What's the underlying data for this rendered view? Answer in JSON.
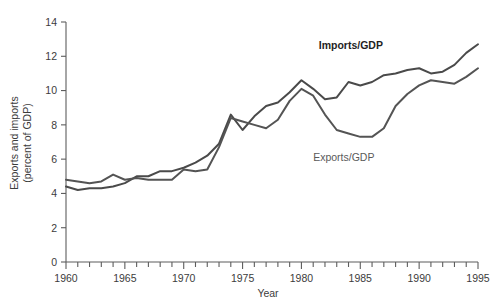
{
  "chart_data": {
    "type": "line",
    "title": "",
    "xlabel": "Year",
    "ylabel": "Exports and imports (percent of GDP)",
    "ylabel_line1": "Exports and imports",
    "ylabel_line2": "(percent of GDP)",
    "xlim": [
      1960,
      1995
    ],
    "ylim": [
      0,
      14
    ],
    "y_ticks": [
      0,
      2,
      4,
      6,
      8,
      10,
      12,
      14
    ],
    "y_tick_labels": [
      "0",
      "2",
      "4",
      "6",
      "8",
      "10",
      "12",
      "14"
    ],
    "x_ticks": [
      1960,
      1961,
      1962,
      1963,
      1964,
      1965,
      1966,
      1967,
      1968,
      1969,
      1970,
      1971,
      1972,
      1973,
      1974,
      1975,
      1976,
      1977,
      1978,
      1979,
      1980,
      1981,
      1982,
      1983,
      1984,
      1985,
      1986,
      1987,
      1988,
      1989,
      1990,
      1991,
      1992,
      1993,
      1994,
      1995
    ],
    "x_tick_labels": [
      "1960",
      "1965",
      "1970",
      "1975",
      "1980",
      "1985",
      "1990",
      "1995"
    ],
    "x_labeled_ticks": [
      1960,
      1965,
      1970,
      1975,
      1980,
      1985,
      1990,
      1995
    ],
    "grid": false,
    "legend_position": "inline-annotation",
    "x": [
      1960,
      1961,
      1962,
      1963,
      1964,
      1965,
      1966,
      1967,
      1968,
      1969,
      1970,
      1971,
      1972,
      1973,
      1974,
      1975,
      1976,
      1977,
      1978,
      1979,
      1980,
      1981,
      1982,
      1983,
      1984,
      1985,
      1986,
      1987,
      1988,
      1989,
      1990,
      1991,
      1992,
      1993,
      1994,
      1995
    ],
    "series": [
      {
        "name": "Imports/GDP",
        "color": "#4a4a4a",
        "label_bold": true,
        "values": [
          4.4,
          4.2,
          4.3,
          4.3,
          4.4,
          4.6,
          5.0,
          5.0,
          5.3,
          5.3,
          5.5,
          5.8,
          6.2,
          6.9,
          8.6,
          7.7,
          8.5,
          9.1,
          9.3,
          9.9,
          10.6,
          10.1,
          9.5,
          9.6,
          10.5,
          10.3,
          10.5,
          10.9,
          11.0,
          11.2,
          11.3,
          11.0,
          11.1,
          11.5,
          12.2,
          12.7
        ]
      },
      {
        "name": "Exports/GDP",
        "color": "#545454",
        "label_bold": false,
        "values": [
          4.8,
          4.7,
          4.6,
          4.7,
          5.1,
          4.8,
          4.9,
          4.8,
          4.8,
          4.8,
          5.4,
          5.3,
          5.4,
          6.7,
          8.4,
          8.2,
          8.0,
          7.8,
          8.3,
          9.4,
          10.1,
          9.7,
          8.6,
          7.7,
          7.5,
          7.3,
          7.3,
          7.8,
          9.1,
          9.8,
          10.3,
          10.6,
          10.5,
          10.4,
          10.8,
          11.3
        ]
      }
    ],
    "annotations": [
      {
        "text": "Imports/GDP",
        "x": 1984.2,
        "y": 12.4,
        "bold": true
      },
      {
        "text": "Exports/GDP",
        "x": 1983.6,
        "y": 5.9,
        "bold": false
      }
    ]
  },
  "axes": {
    "x_axis_title": "Year",
    "y_axis_title_line1": "Exports and imports",
    "y_axis_title_line2": "(percent of GDP)"
  },
  "colors": {
    "imports_line": "#4a4a4a",
    "exports_line": "#545454",
    "axis": "#5d5d5d",
    "text": "#3c3c3c",
    "background": "#ffffff"
  }
}
